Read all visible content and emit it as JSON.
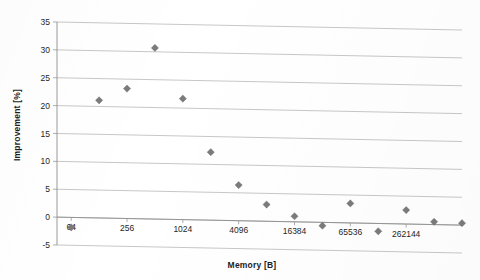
{
  "chart_data": {
    "type": "scatter",
    "title": "",
    "xlabel": "Memory [B]",
    "ylabel": "Improvement [%]",
    "x_scale": "log",
    "x_log_base": 2,
    "x_tick_labels": [
      "64",
      "256",
      "1024",
      "4096",
      "16384",
      "65536",
      "262144"
    ],
    "x_tick_values": [
      64,
      256,
      1024,
      4096,
      16384,
      65536,
      262144
    ],
    "xlim": [
      45,
      1048576
    ],
    "y_tick_labels": [
      "-5",
      "0",
      "5",
      "10",
      "15",
      "20",
      "25",
      "30",
      "35"
    ],
    "y_tick_values": [
      -5,
      0,
      5,
      10,
      15,
      20,
      25,
      30,
      35
    ],
    "ylim": [
      -5,
      35
    ],
    "grid": "horizontal",
    "legend": "none",
    "marker_shape": "diamond",
    "marker_color": "#7b7b7b",
    "x": [
      64,
      128,
      256,
      512,
      1024,
      2048,
      4096,
      8192,
      16384,
      32768,
      65536,
      131072,
      262144,
      524288
    ],
    "y": [
      -1.8,
      21.1,
      23.3,
      30.7,
      21.7,
      12.2,
      6.4,
      3.0,
      1.0,
      -0.6,
      3.5,
      -1.4,
      2.5,
      0.5
    ],
    "points": [
      {
        "x": 64,
        "y": -1.8
      },
      {
        "x": 128,
        "y": 21.1
      },
      {
        "x": 256,
        "y": 23.3
      },
      {
        "x": 512,
        "y": 30.7
      },
      {
        "x": 1024,
        "y": 21.7
      },
      {
        "x": 2048,
        "y": 12.2
      },
      {
        "x": 4096,
        "y": 6.4
      },
      {
        "x": 8192,
        "y": 3.0
      },
      {
        "x": 16384,
        "y": 1.0
      },
      {
        "x": 32768,
        "y": -0.6
      },
      {
        "x": 65536,
        "y": 3.5
      },
      {
        "x": 131072,
        "y": -1.4
      },
      {
        "x": 262144,
        "y": 2.5
      },
      {
        "x": 524288,
        "y": 0.5
      },
      {
        "x": 1048576,
        "y": 0.35
      }
    ]
  },
  "axes": {
    "x_title": "Memory [B]",
    "y_title": "Improvement [%]"
  }
}
